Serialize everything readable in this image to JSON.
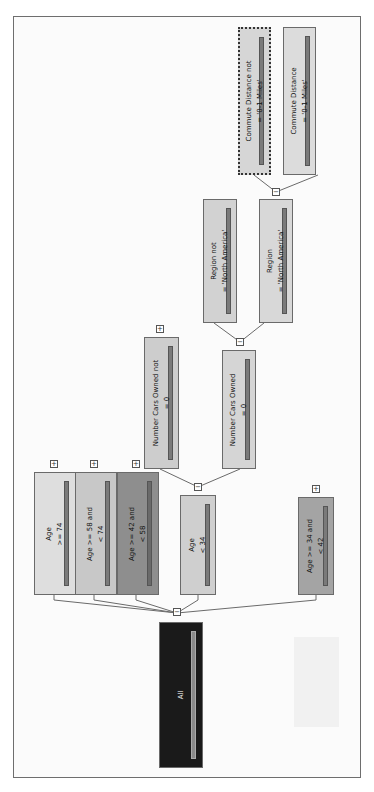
{
  "tree": {
    "orientation": "rotated-90-ccw",
    "root": {
      "id": "all",
      "label": "All",
      "color": "#1a1a1a"
    },
    "level1": [
      {
        "id": "age-ge-74",
        "lines": [
          "Age",
          ">= 74"
        ],
        "color": "#dedede",
        "collapsed": true
      },
      {
        "id": "age-58-74",
        "lines": [
          "Age >= 58 and",
          "< 74"
        ],
        "color": "#c8c8c8",
        "collapsed": true
      },
      {
        "id": "age-42-58",
        "lines": [
          "Age >= 42 and",
          "< 58"
        ],
        "color": "#8e8e8e",
        "collapsed": true
      },
      {
        "id": "age-lt-34",
        "lines": [
          "Age",
          "< 34"
        ],
        "color": "#cfcfcf",
        "collapsed": false
      },
      {
        "id": "age-34-42",
        "lines": [
          "Age >= 34 and",
          "< 42"
        ],
        "color": "#a4a4a4",
        "collapsed": true
      }
    ],
    "level2": [
      {
        "id": "cars-not-0",
        "lines": [
          "Number Cars Owned not",
          "= 0"
        ],
        "color": "#cdcdcd",
        "collapsed": true
      },
      {
        "id": "cars-0",
        "lines": [
          "Number Cars Owned",
          "= 0"
        ],
        "color": "#d5d5d5",
        "collapsed": false
      }
    ],
    "level3": [
      {
        "id": "region-not-na",
        "lines": [
          "Region not",
          "= 'North America'"
        ],
        "color": "#d2d2d2",
        "collapsed": false
      },
      {
        "id": "region-na",
        "lines": [
          "Region",
          "= 'North America'"
        ],
        "color": "#d8d8d8",
        "collapsed": false
      }
    ],
    "level4": [
      {
        "id": "commute-not-0-1",
        "lines": [
          "Commute Distance not",
          "= '0-1 Miles'"
        ],
        "color": "#d6d6d6",
        "selected": true
      },
      {
        "id": "commute-0-1",
        "lines": [
          "Commute Distance",
          "= '0-1 Miles'"
        ],
        "color": "#dcdcdc",
        "selected": false
      }
    ]
  }
}
